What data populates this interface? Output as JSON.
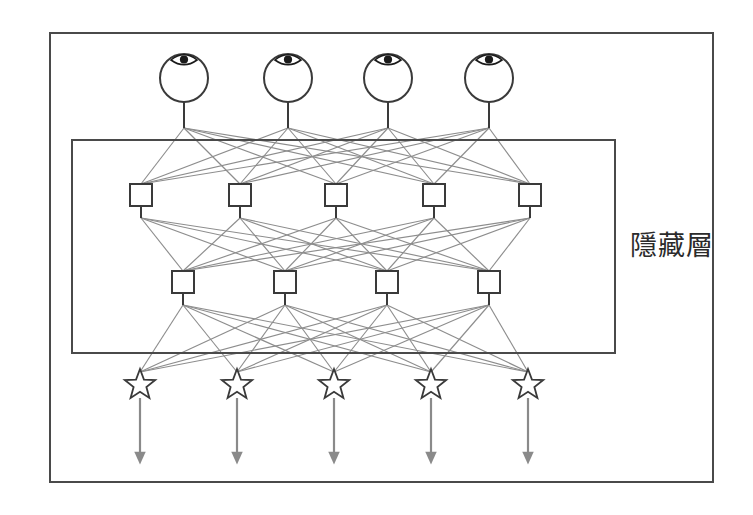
{
  "figure": {
    "background_color": "#ffffff",
    "outer_frame": {
      "name": "outer-frame",
      "x": 50,
      "y": 33,
      "width": 663,
      "height": 449,
      "stroke": "#4a4a4a",
      "stroke_width": 2
    },
    "hidden_layer_box": {
      "name": "hidden-layer-box",
      "label": "隱藏層",
      "label_x": 630,
      "label_y": 255,
      "x": 72,
      "y": 140,
      "width": 543,
      "height": 213,
      "stroke": "#4a4a4a",
      "stroke_width": 2
    }
  },
  "colors": {
    "ink": "#4a4a4a",
    "node_stroke": "#3a3a3a",
    "connection": "#8d8d8d",
    "arrow": "#8a8a8a",
    "pupil": "#1a1a1a",
    "text": "#2b2b2b"
  },
  "layers": [
    {
      "id": "input-layer",
      "name": "input-layer",
      "node_type": "eye",
      "node_label": "eye-node",
      "count": 4,
      "y": 78,
      "radius": 24,
      "stem_bottom": 128,
      "nodes": [
        {
          "id": "in-1",
          "x": 184
        },
        {
          "id": "in-2",
          "x": 288
        },
        {
          "id": "in-3",
          "x": 388
        },
        {
          "id": "in-4",
          "x": 489
        }
      ]
    },
    {
      "id": "hidden-layer-1",
      "name": "hidden-layer-1",
      "node_type": "square",
      "node_label": "hidden-unit",
      "count": 5,
      "y": 195,
      "size": 22,
      "stem_top": 184,
      "stem_bottom": 218,
      "nodes": [
        {
          "id": "h1-1",
          "x": 141
        },
        {
          "id": "h1-2",
          "x": 240
        },
        {
          "id": "h1-3",
          "x": 336
        },
        {
          "id": "h1-4",
          "x": 434
        },
        {
          "id": "h1-5",
          "x": 530
        }
      ]
    },
    {
      "id": "hidden-layer-2",
      "name": "hidden-layer-2",
      "node_type": "square",
      "node_label": "hidden-unit",
      "count": 4,
      "y": 282,
      "size": 22,
      "stem_top": 271,
      "stem_bottom": 305,
      "nodes": [
        {
          "id": "h2-1",
          "x": 183
        },
        {
          "id": "h2-2",
          "x": 285
        },
        {
          "id": "h2-3",
          "x": 387
        },
        {
          "id": "h2-4",
          "x": 489
        }
      ]
    },
    {
      "id": "output-layer",
      "name": "output-layer",
      "node_type": "star",
      "node_label": "output-star",
      "count": 5,
      "y": 385,
      "radius": 16,
      "arrow_top": 398,
      "arrow_bottom": 458,
      "nodes": [
        {
          "id": "out-1",
          "x": 140
        },
        {
          "id": "out-2",
          "x": 237
        },
        {
          "id": "out-3",
          "x": 334
        },
        {
          "id": "out-4",
          "x": 431
        },
        {
          "id": "out-5",
          "x": 528
        }
      ]
    }
  ],
  "connections": [
    {
      "from_layer": "input-layer",
      "to_layer": "hidden-layer-1",
      "fully_connected": true,
      "from_y": 128,
      "to_y": 184
    },
    {
      "from_layer": "hidden-layer-1",
      "to_layer": "hidden-layer-2",
      "fully_connected": true,
      "from_y": 218,
      "to_y": 271
    },
    {
      "from_layer": "hidden-layer-2",
      "to_layer": "output-layer",
      "fully_connected": true,
      "from_y": 305,
      "to_y": 372
    }
  ],
  "output_arrows": {
    "name": "output-arrow",
    "count": 5,
    "direction": "down",
    "color": "#8a8a8a"
  }
}
